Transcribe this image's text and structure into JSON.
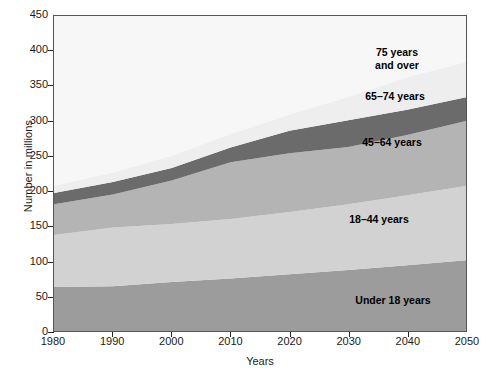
{
  "chart_data": {
    "type": "area",
    "stacked": true,
    "title": "",
    "xlabel": "Years",
    "ylabel": "Number in millions",
    "x": [
      1980,
      1990,
      2000,
      2010,
      2020,
      2030,
      2040,
      2050
    ],
    "xlim": [
      1980,
      2050
    ],
    "ylim": [
      0,
      450
    ],
    "ytick_values": [
      0,
      50,
      100,
      150,
      200,
      250,
      300,
      350,
      400,
      450
    ],
    "ytick_labels": [
      "0",
      "50",
      "100",
      "150",
      "200",
      "250",
      "300",
      "350",
      "400",
      "450"
    ],
    "xtick_labels": [
      "1980",
      "1990",
      "2000",
      "2010",
      "2020",
      "2030",
      "2040",
      "2050"
    ],
    "grid": false,
    "legend_position": "inline-annotations",
    "series": [
      {
        "name": "Under 18 years",
        "color": "#9c9c9c",
        "values": [
          63,
          64,
          70,
          75,
          81,
          87,
          94,
          101
        ]
      },
      {
        "name": "18–44 years",
        "color": "#d2d2d2",
        "values": [
          74,
          84,
          83,
          85,
          89,
          94,
          100,
          106
        ]
      },
      {
        "name": "45–64 years",
        "color": "#b4b4b4",
        "values": [
          44,
          47,
          62,
          81,
          84,
          82,
          86,
          93
        ]
      },
      {
        "name": "65–74 years",
        "color": "#6b6b6b",
        "values": [
          16,
          18,
          18,
          21,
          32,
          38,
          36,
          34
        ]
      },
      {
        "name": "75 years and over",
        "color": "#eeeeee",
        "values": [
          10,
          13,
          17,
          19,
          23,
          33,
          46,
          50
        ]
      }
    ],
    "totals": [
      207,
      226,
      250,
      281,
      309,
      334,
      362,
      384
    ],
    "annotations": [
      {
        "label": "75 years",
        "label2": "and over",
        "x_px": 396,
        "y_px": 58
      },
      {
        "label": "65–74 years",
        "x_px": 394,
        "y_px": 96
      },
      {
        "label": "45–64 years",
        "x_px": 391,
        "y_px": 142
      },
      {
        "label": "18–44 years",
        "x_px": 378,
        "y_px": 219
      },
      {
        "label": "Under 18 years",
        "x_px": 392,
        "y_px": 300
      }
    ]
  }
}
